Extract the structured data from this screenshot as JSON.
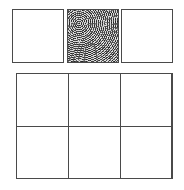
{
  "figure": {
    "width": 184,
    "height": 190,
    "background_color": "#ffffff",
    "border_color": "#4a4a4a",
    "pattern_fill_name": "concentric-circles-texture",
    "plain_fill_color": "#ffffff",
    "pattern_base_color": "#9d9d9d"
  },
  "top_row": {
    "name": "separate-tiles-row",
    "tiles": [
      {
        "id": "top-1",
        "fill": "plain",
        "x": 12,
        "y": 9,
        "w": 52,
        "h": 54
      },
      {
        "id": "top-2",
        "fill": "pattern",
        "x": 67,
        "y": 9,
        "w": 52,
        "h": 54
      },
      {
        "id": "top-3",
        "fill": "plain",
        "x": 121,
        "y": 9,
        "w": 52,
        "h": 54
      }
    ]
  },
  "bottom_block": {
    "name": "grid-block",
    "x": 16,
    "y": 73,
    "w": 156,
    "h": 106,
    "columns": 3,
    "rows": 2,
    "cells": [
      {
        "id": "r1c1",
        "fill": "pattern",
        "x": 16,
        "y": 73,
        "w": 53,
        "h": 54
      },
      {
        "id": "r1c2",
        "fill": "plain",
        "x": 68,
        "y": 73,
        "w": 53,
        "h": 54
      },
      {
        "id": "r1c3",
        "fill": "pattern",
        "x": 120,
        "y": 73,
        "w": 53,
        "h": 54
      },
      {
        "id": "r2c1",
        "fill": "plain",
        "x": 16,
        "y": 126,
        "w": 53,
        "h": 53
      },
      {
        "id": "r2c2",
        "fill": "pattern",
        "x": 68,
        "y": 126,
        "w": 53,
        "h": 53
      },
      {
        "id": "r2c3",
        "fill": "plain",
        "x": 120,
        "y": 126,
        "w": 53,
        "h": 53
      }
    ]
  }
}
